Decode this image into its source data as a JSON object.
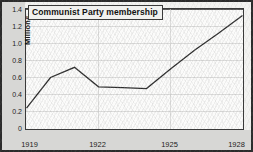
{
  "chart_data": {
    "type": "line",
    "title": "Communist Party membership",
    "xlabel": "",
    "ylabel": "Millions",
    "x": [
      1919,
      1920,
      1921,
      1922,
      1923,
      1924,
      1925,
      1926,
      1927,
      1928
    ],
    "values": [
      0.24,
      0.6,
      0.72,
      0.49,
      0.48,
      0.47,
      0.7,
      0.92,
      1.12,
      1.33
    ],
    "series": [
      {
        "name": "Communist Party membership",
        "values": [
          0.24,
          0.6,
          0.72,
          0.49,
          0.48,
          0.47,
          0.7,
          0.92,
          1.12,
          1.33
        ]
      }
    ],
    "xlim": [
      1919,
      1928
    ],
    "ylim": [
      0,
      1.4
    ],
    "x_tick_labels": [
      "1919",
      "1922",
      "1925",
      "1928"
    ],
    "x_tick_values": [
      1919,
      1922,
      1925,
      1928
    ],
    "y_tick_labels": [
      "0",
      "0.2",
      "0.4",
      "0.6",
      "0.8",
      "1.0",
      "1.2",
      "1.4"
    ],
    "y_tick_values": [
      0,
      0.2,
      0.4,
      0.6,
      0.8,
      1.0,
      1.2,
      1.4
    ],
    "grid": true,
    "legend": false,
    "legend_position": "none",
    "line_color": "#2b2b2b",
    "grid_color": "#cfcfcd",
    "axis_color": "#3a3a3a",
    "plot_background": "#fbfbfa",
    "margin_band_color": "#d7d7d5"
  }
}
